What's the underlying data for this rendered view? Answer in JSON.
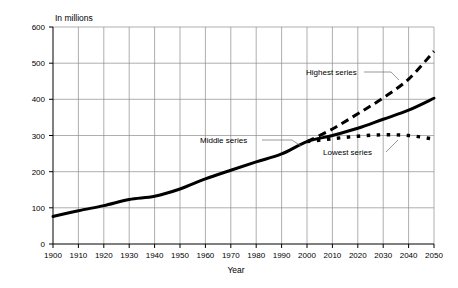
{
  "chart_data": {
    "type": "line",
    "title": "",
    "subtitle": "",
    "unit_label": "In millions",
    "xlabel": "Year",
    "ylabel": "",
    "xlim": [
      1900,
      2050
    ],
    "ylim": [
      0,
      600
    ],
    "grid": true,
    "legend_position": "inline-annotations",
    "x_ticks": [
      1900,
      1910,
      1920,
      1930,
      1940,
      1950,
      1960,
      1970,
      1980,
      1990,
      2000,
      2010,
      2020,
      2030,
      2040,
      2050
    ],
    "x_tick_labels": [
      "1900",
      "1910",
      "1920",
      "1930",
      "1940",
      "1950",
      "1960",
      "1970",
      "1980",
      "1990",
      "2000",
      "2010",
      "2020",
      "2030",
      "2040",
      "2050"
    ],
    "y_ticks": [
      0,
      100,
      200,
      300,
      400,
      500,
      600
    ],
    "y_tick_labels": [
      "0",
      "100",
      "200",
      "300",
      "400",
      "500",
      "600"
    ],
    "x": [
      1900,
      1910,
      1920,
      1930,
      1940,
      1950,
      1960,
      1970,
      1980,
      1990,
      2000,
      2010,
      2020,
      2030,
      2040,
      2050
    ],
    "series": [
      {
        "name": "Highest series",
        "label": "Highest series",
        "style": "dashed",
        "values": [
          null,
          null,
          null,
          null,
          null,
          null,
          null,
          null,
          null,
          null,
          283,
          318,
          360,
          404,
          456,
          533
        ]
      },
      {
        "name": "Middle series",
        "label": "Middle series",
        "style": "solid",
        "values": [
          76,
          92,
          106,
          123,
          132,
          152,
          180,
          204,
          227,
          249,
          283,
          300,
          320,
          345,
          370,
          403
        ]
      },
      {
        "name": "Lowest series",
        "label": "Lowest series",
        "style": "dotted",
        "values": [
          null,
          null,
          null,
          null,
          null,
          null,
          null,
          null,
          null,
          null,
          283,
          291,
          298,
          302,
          300,
          290
        ]
      }
    ],
    "annotations": [
      {
        "text": "Highest series",
        "x": 2010,
        "y": 475
      },
      {
        "text": "Middle series",
        "x": 1975,
        "y": 297
      },
      {
        "text": "Lowest series",
        "x": 2020,
        "y": 255
      }
    ]
  }
}
